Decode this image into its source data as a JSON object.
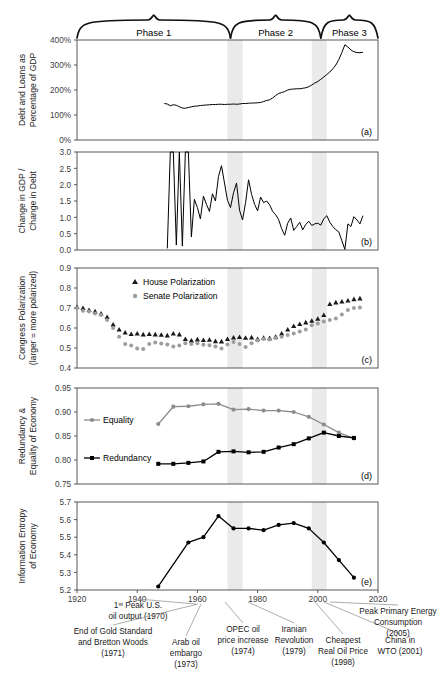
{
  "figure": {
    "phases": [
      {
        "label": "Phase 1",
        "x_start": 1920,
        "x_end": 1971
      },
      {
        "label": "Phase 2",
        "x_start": 1971,
        "x_end": 2001
      },
      {
        "label": "Phase 3",
        "x_start": 2001,
        "x_end": 2020
      }
    ],
    "shaded_bands": [
      {
        "x_start": 1970,
        "x_end": 1975
      },
      {
        "x_start": 1998,
        "x_end": 2003
      }
    ],
    "panel_tags": [
      "(a)",
      "(b)",
      "(c)",
      "(d)",
      "(e)"
    ],
    "x_axis": {
      "ticks": [
        1920,
        1940,
        1960,
        1980,
        2000,
        2020
      ],
      "tick_labels": [
        "1920",
        "1940",
        "1960",
        "1980",
        "2000",
        "2020"
      ],
      "min": 1920,
      "max": 2020
    },
    "annotations": [
      {
        "id": "peak-oil-1970",
        "lines": [
          "1ˢᵗ Peak U.S.",
          "oil output (1970)"
        ],
        "year": 1970
      },
      {
        "id": "gold-standard-1971",
        "lines": [
          "End of Gold Standard",
          "and Bretton Woods",
          "(1971)"
        ],
        "year": 1971
      },
      {
        "id": "arab-oil-embargo-1973",
        "lines": [
          "Arab oil",
          "embargo",
          "(1973)"
        ],
        "year": 1973
      },
      {
        "id": "opec-oil-price-1974",
        "lines": [
          "OPEC oil",
          "price increase",
          "(1974)"
        ],
        "year": 1974
      },
      {
        "id": "iranian-revolution-1979",
        "lines": [
          "Iranian",
          "Revolution",
          "(1979)"
        ],
        "year": 1979
      },
      {
        "id": "cheapest-real-oil-1998",
        "lines": [
          "Cheapest",
          "Real Oil Price",
          "(1998)"
        ],
        "year": 1998
      },
      {
        "id": "china-wto-2001",
        "lines": [
          "China in",
          "WTO (2001)"
        ],
        "year": 2001
      },
      {
        "id": "peak-primary-energy-2005",
        "lines": [
          "Peak Primary Energy",
          "Consumption",
          "(2005)"
        ],
        "year": 2005
      }
    ]
  },
  "chart_data": [
    {
      "type": "line",
      "panel": "a",
      "title": "",
      "ylabel": "Debt and Loans as Percentage of GDP",
      "xlabel": "",
      "ylim": [
        0,
        400
      ],
      "yticks": [
        0,
        100,
        200,
        300,
        400
      ],
      "ytick_labels": [
        "0%",
        "100%",
        "200%",
        "300%",
        "400%"
      ],
      "xlim": [
        1920,
        2020
      ],
      "grid": false,
      "series": [
        {
          "name": "Debt and Loans as Percentage of GDP",
          "color": "#000000",
          "x": [
            1949,
            1950,
            1951,
            1952,
            1953,
            1954,
            1955,
            1956,
            1957,
            1958,
            1959,
            1960,
            1961,
            1962,
            1963,
            1964,
            1965,
            1966,
            1967,
            1968,
            1969,
            1970,
            1971,
            1972,
            1973,
            1974,
            1975,
            1976,
            1977,
            1978,
            1979,
            1980,
            1981,
            1982,
            1983,
            1984,
            1985,
            1986,
            1987,
            1988,
            1989,
            1990,
            1991,
            1992,
            1993,
            1994,
            1995,
            1996,
            1997,
            1998,
            1999,
            2000,
            2001,
            2002,
            2003,
            2004,
            2005,
            2006,
            2007,
            2008,
            2009,
            2010,
            2011,
            2012,
            2013,
            2014,
            2015
          ],
          "values": [
            146,
            144,
            137,
            141,
            139,
            133,
            128,
            127,
            130,
            133,
            135,
            136,
            138,
            139,
            140,
            141,
            142,
            142,
            143,
            143,
            142,
            143,
            143,
            144,
            143,
            144,
            146,
            146,
            147,
            148,
            148,
            149,
            150,
            154,
            158,
            161,
            168,
            178,
            186,
            190,
            194,
            200,
            203,
            204,
            205,
            205,
            207,
            209,
            213,
            220,
            228,
            234,
            243,
            252,
            262,
            272,
            285,
            300,
            322,
            350,
            381,
            372,
            360,
            353,
            350,
            349,
            351
          ]
        }
      ]
    },
    {
      "type": "line",
      "panel": "b",
      "title": "",
      "ylabel": "Change in GDP / Change in Debt",
      "xlabel": "",
      "ylim": [
        0.0,
        3.0
      ],
      "yticks": [
        0.0,
        0.5,
        1.0,
        1.5,
        2.0,
        2.5,
        3.0
      ],
      "ytick_labels": [
        "0.0",
        "0.5",
        "1.0",
        "1.5",
        "2.0",
        "2.5",
        "3.0"
      ],
      "xlim": [
        1920,
        2020
      ],
      "grid": false,
      "series": [
        {
          "name": "Change in GDP / Change in Debt",
          "color": "#000000",
          "x": [
            1950,
            1951,
            1952,
            1953,
            1954,
            1955,
            1956,
            1957,
            1958,
            1959,
            1960,
            1961,
            1962,
            1963,
            1964,
            1965,
            1966,
            1967,
            1968,
            1969,
            1970,
            1971,
            1972,
            1973,
            1974,
            1975,
            1976,
            1977,
            1978,
            1979,
            1980,
            1981,
            1982,
            1983,
            1984,
            1985,
            1986,
            1987,
            1988,
            1989,
            1990,
            1991,
            1992,
            1993,
            1994,
            1995,
            1996,
            1997,
            1998,
            1999,
            2000,
            2001,
            2002,
            2003,
            2004,
            2005,
            2006,
            2007,
            2008,
            2009,
            2010,
            2011,
            2012,
            2013,
            2014,
            2015
          ],
          "values": [
            0.05,
            3.6,
            3.9,
            0.15,
            3.8,
            0.12,
            3.3,
            3.0,
            0.4,
            1.55,
            1.3,
            0.95,
            1.65,
            1.4,
            1.18,
            1.72,
            1.5,
            2.25,
            2.58,
            2.05,
            1.52,
            1.3,
            1.75,
            2.05,
            1.22,
            0.92,
            1.45,
            2.15,
            1.7,
            1.4,
            1.2,
            1.62,
            1.45,
            1.5,
            1.38,
            1.18,
            1.08,
            0.93,
            0.65,
            0.45,
            0.82,
            0.98,
            0.6,
            0.72,
            0.85,
            0.62,
            0.78,
            0.88,
            0.75,
            0.8,
            0.82,
            0.76,
            0.96,
            1.05,
            0.85,
            0.72,
            0.62,
            0.55,
            0.28,
            0.02,
            0.8,
            0.72,
            1.02,
            0.92,
            0.8,
            1.05
          ]
        }
      ]
    },
    {
      "type": "scatter",
      "panel": "c",
      "title": "",
      "ylabel": "Congress Polarization (larger = more polarized)",
      "xlabel": "",
      "ylim": [
        0.4,
        0.9
      ],
      "yticks": [
        0.4,
        0.5,
        0.6,
        0.7,
        0.8,
        0.9
      ],
      "ytick_labels": [
        "0.4",
        "0.5",
        "0.6",
        "0.7",
        "0.8",
        "0.9"
      ],
      "xlim": [
        1920,
        2020
      ],
      "grid": false,
      "legend_position": "top-left",
      "series": [
        {
          "name": "House Polarization",
          "marker": "triangle",
          "color": "#1a1a1a",
          "x": [
            1920,
            1922,
            1924,
            1926,
            1928,
            1930,
            1932,
            1934,
            1936,
            1938,
            1940,
            1942,
            1944,
            1946,
            1948,
            1950,
            1952,
            1954,
            1956,
            1958,
            1960,
            1962,
            1964,
            1966,
            1968,
            1970,
            1972,
            1974,
            1976,
            1978,
            1980,
            1982,
            1984,
            1986,
            1988,
            1990,
            1992,
            1994,
            1996,
            1998,
            2000,
            2002,
            2004,
            2006,
            2008,
            2010,
            2012,
            2014
          ],
          "values": [
            0.705,
            0.7,
            0.69,
            0.683,
            0.672,
            0.655,
            0.617,
            0.592,
            0.577,
            0.57,
            0.572,
            0.568,
            0.57,
            0.568,
            0.566,
            0.563,
            0.572,
            0.568,
            0.545,
            0.537,
            0.543,
            0.54,
            0.541,
            0.534,
            0.533,
            0.545,
            0.552,
            0.555,
            0.551,
            0.553,
            0.545,
            0.551,
            0.549,
            0.556,
            0.572,
            0.592,
            0.61,
            0.62,
            0.628,
            0.636,
            0.646,
            0.665,
            0.72,
            0.728,
            0.732,
            0.737,
            0.744,
            0.748
          ]
        },
        {
          "name": "Senate Polarization",
          "marker": "circle",
          "color": "#9d9d9d",
          "x": [
            1920,
            1922,
            1924,
            1926,
            1928,
            1930,
            1932,
            1934,
            1936,
            1938,
            1940,
            1942,
            1944,
            1946,
            1948,
            1950,
            1952,
            1954,
            1956,
            1958,
            1960,
            1962,
            1964,
            1966,
            1968,
            1970,
            1972,
            1974,
            1976,
            1978,
            1980,
            1982,
            1984,
            1986,
            1988,
            1990,
            1992,
            1994,
            1996,
            1998,
            2000,
            2002,
            2004,
            2006,
            2008,
            2010,
            2012,
            2014
          ],
          "values": [
            0.7,
            0.686,
            0.683,
            0.672,
            0.665,
            0.64,
            0.6,
            0.556,
            0.52,
            0.512,
            0.498,
            0.495,
            0.52,
            0.528,
            0.522,
            0.517,
            0.508,
            0.512,
            0.524,
            0.52,
            0.524,
            0.516,
            0.514,
            0.508,
            0.498,
            0.517,
            0.53,
            0.52,
            0.505,
            0.524,
            0.538,
            0.545,
            0.543,
            0.55,
            0.556,
            0.565,
            0.572,
            0.583,
            0.592,
            0.614,
            0.622,
            0.632,
            0.64,
            0.648,
            0.668,
            0.69,
            0.7,
            0.702
          ]
        }
      ]
    },
    {
      "type": "line",
      "panel": "d",
      "title": "",
      "ylabel": "Redundancy & Equality of Economy",
      "xlabel": "",
      "ylim": [
        0.75,
        0.95
      ],
      "yticks": [
        0.75,
        0.8,
        0.85,
        0.9,
        0.95
      ],
      "ytick_labels": [
        "0.75",
        "0.80",
        "0.85",
        "0.90",
        "0.95"
      ],
      "xlim": [
        1920,
        2020
      ],
      "grid": false,
      "legend_position": "left",
      "series": [
        {
          "name": "Equality",
          "marker": "circle",
          "color": "#8c8c8c",
          "x": [
            1947,
            1952,
            1957,
            1962,
            1967,
            1972,
            1977,
            1982,
            1987,
            1992,
            1997,
            2002,
            2007,
            2012
          ],
          "values": [
            0.875,
            0.911,
            0.912,
            0.916,
            0.917,
            0.905,
            0.906,
            0.903,
            0.903,
            0.9,
            0.89,
            0.874,
            0.857,
            0.845
          ]
        },
        {
          "name": "Redundancy",
          "marker": "square",
          "color": "#000000",
          "x": [
            1947,
            1952,
            1957,
            1962,
            1967,
            1972,
            1977,
            1982,
            1987,
            1992,
            1997,
            2002,
            2007,
            2012
          ],
          "values": [
            0.792,
            0.792,
            0.794,
            0.797,
            0.817,
            0.818,
            0.816,
            0.817,
            0.826,
            0.833,
            0.845,
            0.857,
            0.85,
            0.846
          ]
        }
      ]
    },
    {
      "type": "line",
      "panel": "e",
      "title": "",
      "ylabel": "Information Entropy of Economy",
      "xlabel": "",
      "ylim": [
        5.2,
        5.7
      ],
      "yticks": [
        5.2,
        5.3,
        5.4,
        5.5,
        5.6,
        5.7
      ],
      "ytick_labels": [
        "5.2",
        "5.3",
        "5.4",
        "5.5",
        "5.6",
        "5.7"
      ],
      "xlim": [
        1920,
        2020
      ],
      "grid": false,
      "series": [
        {
          "name": "Information Entropy of Economy",
          "marker": "circle",
          "color": "#000000",
          "x": [
            1947,
            1957,
            1962,
            1967,
            1972,
            1977,
            1982,
            1987,
            1992,
            1997,
            2002,
            2007,
            2012
          ],
          "values": [
            5.22,
            5.47,
            5.5,
            5.62,
            5.55,
            5.55,
            5.54,
            5.57,
            5.58,
            5.55,
            5.47,
            5.37,
            5.27
          ]
        }
      ]
    }
  ]
}
